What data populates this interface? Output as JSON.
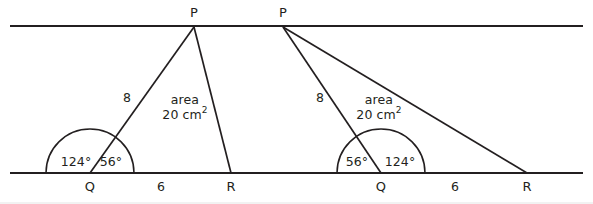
{
  "figure": {
    "stroke_color": "#231f20",
    "background_color": "#ffffff",
    "width": 593,
    "height": 204
  },
  "left_triangle": {
    "apex_label": "P",
    "left_base_label": "Q",
    "right_base_label": "R",
    "side_length": "8",
    "base_length": "6",
    "exterior_angle": "124°",
    "interior_angle": "56°",
    "area_line1": "area",
    "area_value": "20 cm",
    "area_unit_exponent": "2"
  },
  "right_triangle": {
    "apex_label": "P",
    "left_base_label": "Q",
    "right_base_label": "R",
    "side_length": "8",
    "base_length": "6",
    "interior_angle": "56°",
    "exterior_angle": "124°",
    "area_line1": "area",
    "area_value": "20 cm",
    "area_unit_exponent": "2"
  },
  "geometry": {
    "top_rail_y": 26,
    "bottom_rail_y": 173,
    "rail_x_start": 10,
    "rail_x_end": 583
  }
}
